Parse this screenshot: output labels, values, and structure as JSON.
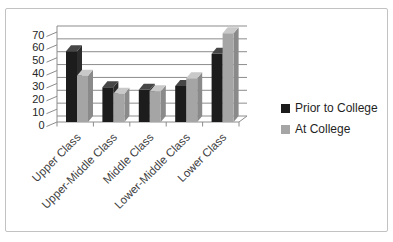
{
  "chart_data": {
    "type": "bar",
    "style": "3d-clustered-column",
    "title": "",
    "xlabel": "",
    "ylabel": "",
    "categories": [
      "Upper Class",
      "Upper-Middle Class",
      "Middle Class",
      "Lower-Middle Class",
      "Lower Class"
    ],
    "series": [
      {
        "name": "Prior to College",
        "values": [
          55,
          27,
          25,
          28,
          53
        ],
        "color": "#1c1c1c",
        "top_color": "#474747",
        "side_color": "#2b2b2b"
      },
      {
        "name": "At College",
        "values": [
          36,
          22,
          24,
          34,
          69
        ],
        "color": "#a5a5a5",
        "top_color": "#c9c9c9",
        "side_color": "#8a8a8a"
      }
    ],
    "ylim": [
      0,
      70
    ],
    "yticks": [
      0,
      10,
      20,
      30,
      40,
      50,
      60,
      70
    ],
    "grid": true,
    "legend_position": "right"
  },
  "colors": {
    "background": "#ffffff",
    "frame_border": "#c2c2c2",
    "grid_line": "#8c8c8c",
    "axis_line": "#8c8c8c",
    "tick_label": "#262626",
    "category_label": "#3d3d3d",
    "legend_text": "#1f1f1f"
  }
}
